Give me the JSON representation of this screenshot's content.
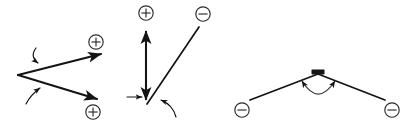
{
  "figure": {
    "background_color": "#ffffff",
    "stroke_color": "#141414",
    "arc_color": "#3d3d3d",
    "width": 413,
    "height": 134,
    "panel_count": 3
  },
  "charge_glyphs": {
    "plus": "⊕",
    "minus": "⊖"
  },
  "panels": [
    {
      "id": "panel-left",
      "name": "bond-homolysis-scheme",
      "description": "Two bonds diverging from a shared vertex, each bearing a fishhook-style curved arrow, terminating in cationic centers",
      "vertex": {
        "x": 18,
        "y": 75
      },
      "bonds": [
        {
          "name": "upper-bond",
          "from": {
            "x": 18,
            "y": 75
          },
          "to": {
            "x": 104,
            "y": 53
          },
          "arrowhead": "full",
          "terminal_charge": "plus"
        },
        {
          "name": "lower-bond",
          "from": {
            "x": 18,
            "y": 75
          },
          "to": {
            "x": 100,
            "y": 100
          },
          "arrowhead": "full",
          "terminal_charge": "plus"
        }
      ],
      "curved_arrows": [
        {
          "name": "upper-electron-arrow",
          "start": {
            "x": 36,
            "y": 48
          },
          "control": {
            "x": 30,
            "y": 57
          },
          "end": {
            "x": 39,
            "y": 64
          },
          "points_to": "upper-bond"
        },
        {
          "name": "lower-electron-arrow",
          "start": {
            "x": 26,
            "y": 104
          },
          "control": {
            "x": 30,
            "y": 96
          },
          "end": {
            "x": 41,
            "y": 87
          },
          "points_to": "lower-bond"
        }
      ],
      "charge_markers": [
        {
          "name": "upper-cation",
          "glyph": "plus",
          "x": 96,
          "y": 42
        },
        {
          "name": "lower-cation",
          "glyph": "plus",
          "x": 93,
          "y": 112
        }
      ]
    },
    {
      "id": "panel-middle",
      "name": "vertical-double-arrow-scheme",
      "description": "Vertical double-headed arrow capped with a cation, plus a diagonal bond rising to an anion, with electron-flow arrows at the base",
      "bonds": [
        {
          "name": "vertical-double-arrow",
          "from": {
            "x": 146,
            "y": 103
          },
          "to": {
            "x": 146,
            "y": 28
          },
          "arrowhead": "both",
          "top_charge": "plus"
        },
        {
          "name": "diagonal-bond",
          "from": {
            "x": 146,
            "y": 104
          },
          "to": {
            "x": 199,
            "y": 27
          },
          "arrowhead": "none",
          "terminal_charge": "minus"
        }
      ],
      "straight_arrows": [
        {
          "name": "horizontal-pointer-arrow",
          "from": {
            "x": 127,
            "y": 97
          },
          "to": {
            "x": 143,
            "y": 97
          },
          "arrowhead": "full"
        }
      ],
      "curved_arrows": [
        {
          "name": "diagonal-electron-arrow",
          "start": {
            "x": 175,
            "y": 116
          },
          "control": {
            "x": 172,
            "y": 105
          },
          "end": {
            "x": 159,
            "y": 99
          },
          "points_to": "diagonal-bond"
        }
      ],
      "charge_markers": [
        {
          "name": "top-cation",
          "glyph": "plus",
          "x": 146,
          "y": 13
        },
        {
          "name": "top-anion",
          "glyph": "minus",
          "x": 202,
          "y": 14
        }
      ]
    },
    {
      "id": "panel-right",
      "name": "bridging-anion-scheme",
      "description": "Inverted-V framework with a bold bond marker at the apex and a wide double-headed arc spanning beneath, flanked by two anions",
      "apex": {
        "x": 318,
        "y": 74
      },
      "bonds": [
        {
          "name": "left-arm",
          "from": {
            "x": 318,
            "y": 74
          },
          "to": {
            "x": 250,
            "y": 100
          },
          "arrowhead": "none",
          "terminal_charge": "minus"
        },
        {
          "name": "right-arm",
          "from": {
            "x": 318,
            "y": 74
          },
          "to": {
            "x": 385,
            "y": 100
          },
          "arrowhead": "none",
          "terminal_charge": "minus"
        }
      ],
      "apex_marker": {
        "name": "bold-bond-marker",
        "x": 312,
        "y": 70,
        "width": 13,
        "height": 5
      },
      "curved_arrows": [
        {
          "name": "bridging-double-headed-arc",
          "start": {
            "x": 301,
            "y": 80
          },
          "control": {
            "x": 318,
            "y": 106
          },
          "end": {
            "x": 336,
            "y": 80
          },
          "arrowhead": "both"
        }
      ],
      "charge_markers": [
        {
          "name": "left-anion",
          "glyph": "minus",
          "x": 242,
          "y": 110
        },
        {
          "name": "right-anion",
          "glyph": "minus",
          "x": 392,
          "y": 110
        }
      ]
    }
  ]
}
